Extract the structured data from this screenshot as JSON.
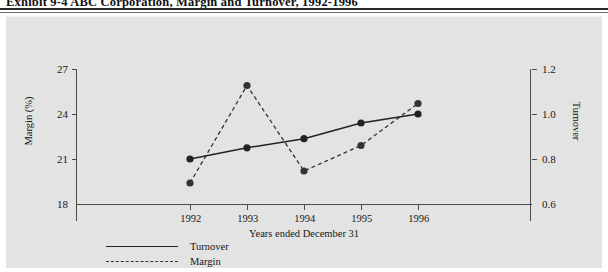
{
  "title": "Exhibit 9-4   ABC Corporation, Margin and Turnover, 1992-1996",
  "panel": {
    "background_color": "#e3e3e3"
  },
  "axes": {
    "left": {
      "title": "Margin (%)",
      "ticks": [
        "27",
        "24",
        "21",
        "18"
      ],
      "min": 18,
      "max": 27,
      "step": 3
    },
    "right": {
      "title": "Turnover",
      "ticks": [
        "1.2",
        "1.0",
        "0.8",
        "0.6"
      ],
      "min": 0.6,
      "max": 1.2,
      "step": 0.2
    },
    "bottom": {
      "title": "Years ended December 31",
      "ticks": [
        "1992",
        "1993",
        "1994",
        "1995",
        "1996"
      ]
    }
  },
  "legend": {
    "entries": [
      {
        "label": "Turnover",
        "style": "solid",
        "color": "#222222"
      },
      {
        "label": "Margin",
        "style": "dashed",
        "color": "#333333"
      }
    ]
  },
  "chart_data": {
    "type": "line",
    "title": "Exhibit 9-4   ABC Corporation, Margin and Turnover, 1992-1996",
    "xlabel": "Years ended December 31",
    "ylabel": "Margin (%)",
    "y2label": "Turnover",
    "x": [
      "1992",
      "1993",
      "1994",
      "1995",
      "1996"
    ],
    "ylim": [
      18,
      27
    ],
    "y2lim": [
      0.6,
      1.2
    ],
    "grid": false,
    "legend_position": "bottom-left",
    "series": [
      {
        "name": "Turnover",
        "axis": "right",
        "style": "solid",
        "marker": "filled-circle",
        "color": "#222222",
        "values": [
          0.8,
          0.85,
          0.89,
          0.96,
          1.0
        ]
      },
      {
        "name": "Margin",
        "axis": "left",
        "style": "dashed",
        "marker": "filled-circle",
        "color": "#333333",
        "values": [
          19.4,
          25.9,
          20.2,
          21.9,
          24.7
        ]
      }
    ]
  }
}
